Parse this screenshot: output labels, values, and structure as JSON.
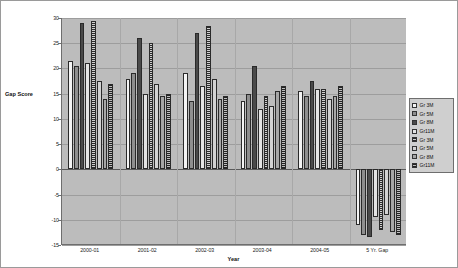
{
  "chart_data": {
    "type": "bar",
    "title": "",
    "xlabel": "Year",
    "ylabel": "Gap Score",
    "ylim": [
      -15,
      30
    ],
    "ytick_step": 5,
    "yticks": [
      30,
      25,
      20,
      15,
      10,
      5,
      0,
      -5,
      -10,
      -15
    ],
    "grid": true,
    "legend_position": "right",
    "categories": [
      "2000-01",
      "2001-02",
      "2002-03",
      "2003-04",
      "2004-05",
      "5 Yr. Gap"
    ],
    "series": [
      {
        "name": "Gr 3M",
        "swatch": "white",
        "values": [
          21.5,
          18.0,
          19.0,
          13.5,
          15.5,
          -11.0
        ]
      },
      {
        "name": "Gr 5M",
        "swatch": "midgrey",
        "values": [
          20.5,
          19.0,
          13.5,
          15.0,
          14.5,
          -13.0
        ]
      },
      {
        "name": "Gr 8M",
        "swatch": "dark",
        "values": [
          29.0,
          26.0,
          27.0,
          20.5,
          17.5,
          -13.5
        ]
      },
      {
        "name": "Gr11M",
        "swatch": "vlight",
        "values": [
          21.0,
          15.0,
          16.5,
          12.0,
          16.0,
          -9.5
        ]
      },
      {
        "name": "Gr 3M",
        "swatch": "hatch-dark",
        "values": [
          29.5,
          25.0,
          28.5,
          14.5,
          16.0,
          -12.0
        ]
      },
      {
        "name": "Gr 5M",
        "swatch": "lightgrey",
        "values": [
          17.5,
          17.0,
          18.0,
          12.5,
          14.0,
          -9.0
        ]
      },
      {
        "name": "Gr 8M",
        "swatch": "grey2",
        "values": [
          14.0,
          14.5,
          14.0,
          15.5,
          14.5,
          -12.5
        ]
      },
      {
        "name": "Gr11M",
        "swatch": "dot-dark",
        "values": [
          17.0,
          15.0,
          14.5,
          16.5,
          16.5,
          -13.0
        ]
      }
    ]
  },
  "axes": {
    "y_title": "Gap Score",
    "x_title": "Year"
  },
  "legend": {
    "items": [
      {
        "label": "Gr 3M"
      },
      {
        "label": "Gr 5M"
      },
      {
        "label": "Gr 8M"
      },
      {
        "label": "Gr11M"
      },
      {
        "label": "Gr 3M"
      },
      {
        "label": "Gr 5M"
      },
      {
        "label": "Gr 8M"
      },
      {
        "label": "Gr11M"
      }
    ]
  },
  "colors": {
    "plot_background": "#bcbcbc",
    "frame_border": "#9a9a9a",
    "gridline": "#9d9d9d",
    "axis_line": "#6e6e6e",
    "text": "#1a1a1a"
  }
}
